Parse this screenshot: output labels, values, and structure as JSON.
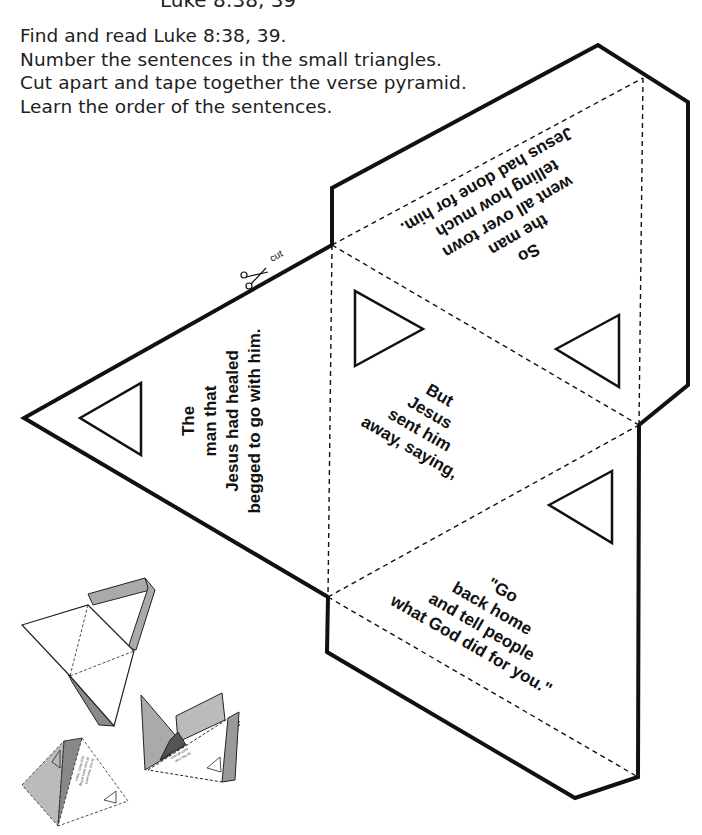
{
  "header": {
    "top_fragment": "Luke 8:38, 39"
  },
  "instructions": [
    "Find and read Luke 8:38, 39.",
    "Number the sentences in the small triangles.",
    "Cut apart and tape together the verse pyramid.",
    "Learn the order of the sentences."
  ],
  "cut_label": "cut",
  "pyramid": {
    "faces": [
      {
        "id": "left",
        "lines": [
          "The",
          "man that",
          "Jesus had healed",
          "begged to go with him."
        ]
      },
      {
        "id": "center",
        "lines": [
          "But",
          "Jesus",
          "sent him",
          "away, saying,"
        ]
      },
      {
        "id": "top-right",
        "lines": [
          "So",
          "the man",
          "went all over town",
          "telling how much",
          "Jesus had done for him."
        ]
      },
      {
        "id": "bottom-right",
        "lines": [
          "\"Go",
          "back home",
          "and tell people",
          "what God did for you.\""
        ]
      }
    ],
    "colors": {
      "line": "#111111",
      "tab_shade": "#a9a9a9",
      "tab_dark": "#7a7a7a",
      "face": "#ffffff"
    }
  }
}
